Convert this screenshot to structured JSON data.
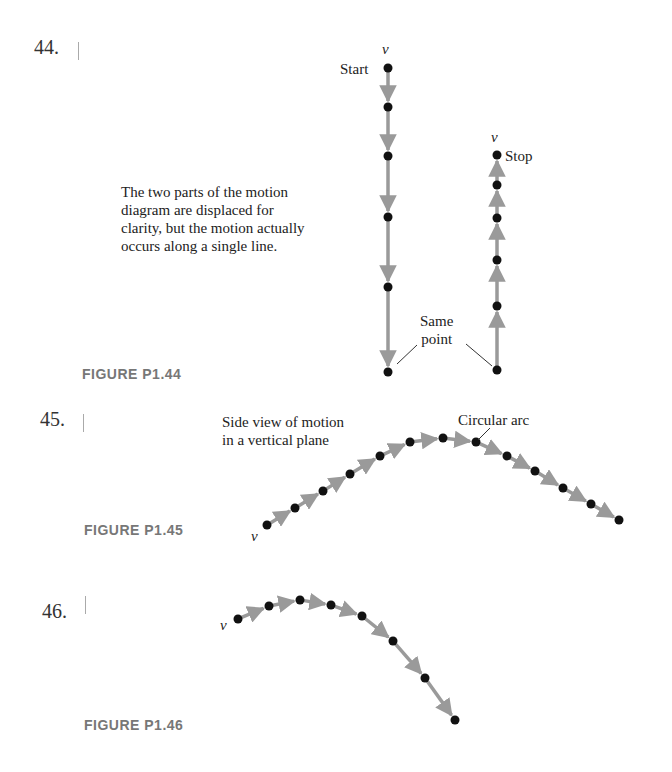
{
  "problems": [
    {
      "number": "44.",
      "caption": "FIGURE P1.44"
    },
    {
      "number": "45.",
      "caption": "FIGURE P1.45"
    },
    {
      "number": "46.",
      "caption": "FIGURE P1.46"
    }
  ],
  "figure44": {
    "note_lines": [
      "The two parts of the motion",
      "diagram are displaced for",
      "clarity, but the motion actually",
      "occurs along a single line."
    ],
    "start_label": "Start",
    "stop_label": "Stop",
    "same_point_lines": [
      "Same",
      "point"
    ],
    "velocity_symbol": "v⃗",
    "down_dots_y": [
      68,
      107,
      156,
      217,
      287,
      372
    ],
    "down_x": 388,
    "up_dots_y": [
      155,
      185,
      218,
      260,
      306,
      370
    ],
    "up_x": 497
  },
  "figure45": {
    "label_lines": [
      "Side view of motion",
      "in a vertical plane"
    ],
    "arc_label": "Circular arc",
    "velocity_symbol": "v⃗",
    "dots": [
      [
        267,
        525
      ],
      [
        295,
        508
      ],
      [
        323,
        491
      ],
      [
        350,
        474
      ],
      [
        380,
        456
      ],
      [
        410,
        442
      ],
      [
        443,
        438
      ],
      [
        476,
        442
      ],
      [
        507,
        456
      ],
      [
        535,
        471
      ],
      [
        563,
        488
      ],
      [
        591,
        504
      ],
      [
        619,
        520
      ]
    ]
  },
  "figure46": {
    "velocity_symbol": "v⃗",
    "dots": [
      [
        238,
        619
      ],
      [
        269,
        606
      ],
      [
        300,
        600
      ],
      [
        331,
        605
      ],
      [
        362,
        616
      ],
      [
        393,
        641
      ],
      [
        425,
        678
      ],
      [
        455,
        720
      ]
    ]
  },
  "colors": {
    "dot": "#111111",
    "arrow": "#9a9a9a",
    "caption": "#777777"
  }
}
